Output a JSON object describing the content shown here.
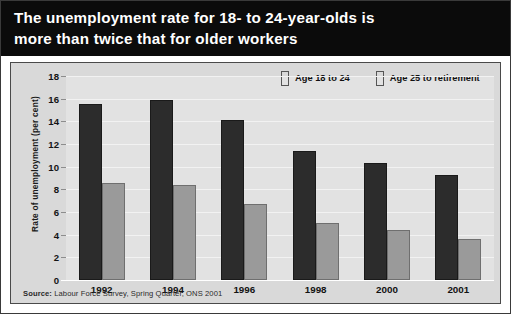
{
  "title": "The unemployment rate for 18- to 24-year-olds is\nmore than twice that for older workers",
  "source": {
    "prefix": "Source:",
    "text": " Labour Force Survey, Spring Quarter, ONS 2001"
  },
  "colors": {
    "title_background": "#0b0b0b",
    "title_text": "#ffffff",
    "plot_background": "#e2e2e2",
    "frame_background": "#d9d9d9",
    "series_young": "#2c2c2c",
    "series_older": "#9a9a9a",
    "gridline": "#f2f2f2"
  },
  "chart_data": {
    "type": "bar",
    "title": "The unemployment rate for 18- to 24-year-olds is more than twice that for older workers",
    "categories": [
      "1992",
      "1994",
      "1996",
      "1998",
      "2000",
      "2001"
    ],
    "series": [
      {
        "name": "Age 18 to 24",
        "color": "#2c2c2c",
        "values": [
          15.5,
          15.9,
          14.1,
          11.4,
          10.3,
          9.3
        ]
      },
      {
        "name": "Age 25 to retirement",
        "color": "#9a9a9a",
        "values": [
          8.6,
          8.4,
          6.7,
          5.0,
          4.4,
          3.6
        ]
      }
    ],
    "xlabel": "",
    "ylabel": "Rate of unemployment (per cent)",
    "ylim": [
      0,
      18
    ],
    "yticks": [
      0,
      2,
      4,
      6,
      8,
      10,
      12,
      14,
      16,
      18
    ],
    "grid": true,
    "legend_position": "top-right"
  }
}
